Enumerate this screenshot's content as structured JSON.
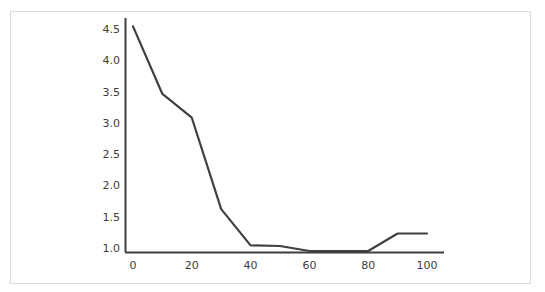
{
  "figure": {
    "background_color": "#ffffff",
    "border_color": "#d9dade",
    "line_color": "#404040",
    "axis_color": "#3d3d3d",
    "tick_text_color": "#3d3d3d"
  },
  "chart_data": {
    "type": "line",
    "title": "",
    "subtitle": "",
    "xlabel": "",
    "ylabel": "",
    "x": [
      0,
      10,
      20,
      30,
      40,
      50,
      60,
      70,
      80,
      90,
      100
    ],
    "values": [
      4.55,
      3.47,
      3.09,
      1.63,
      1.05,
      1.04,
      0.96,
      0.96,
      0.96,
      1.24,
      1.24
    ],
    "series": [
      {
        "name": "series-1",
        "color": "#404040",
        "values": [
          4.55,
          3.47,
          3.09,
          1.63,
          1.05,
          1.04,
          0.96,
          0.96,
          0.96,
          1.24,
          1.24
        ]
      }
    ],
    "xlim": [
      -3,
      106
    ],
    "ylim": [
      0.87,
      4.75
    ],
    "xticks": [
      0,
      20,
      40,
      60,
      80,
      100
    ],
    "xtick_labels": [
      "0",
      "20",
      "40",
      "60",
      "80",
      "100"
    ],
    "yticks": [
      1.0,
      1.5,
      2.0,
      2.5,
      3.0,
      3.5,
      4.0,
      4.5
    ],
    "ytick_labels": [
      "1.0",
      "1.5",
      "2.0",
      "2.5",
      "3.0",
      "3.5",
      "4.0",
      "4.5"
    ],
    "grid": false,
    "legend": false,
    "legend_position": "none",
    "markers": false,
    "annotations": []
  },
  "axes": {
    "y_tick_0": "1.0",
    "y_tick_1": "1.5",
    "y_tick_2": "2.0",
    "y_tick_3": "2.5",
    "y_tick_4": "3.0",
    "y_tick_5": "3.5",
    "y_tick_6": "4.0",
    "y_tick_7": "4.5",
    "x_tick_0": "0",
    "x_tick_1": "20",
    "x_tick_2": "40",
    "x_tick_3": "60",
    "x_tick_4": "80",
    "x_tick_5": "100"
  }
}
